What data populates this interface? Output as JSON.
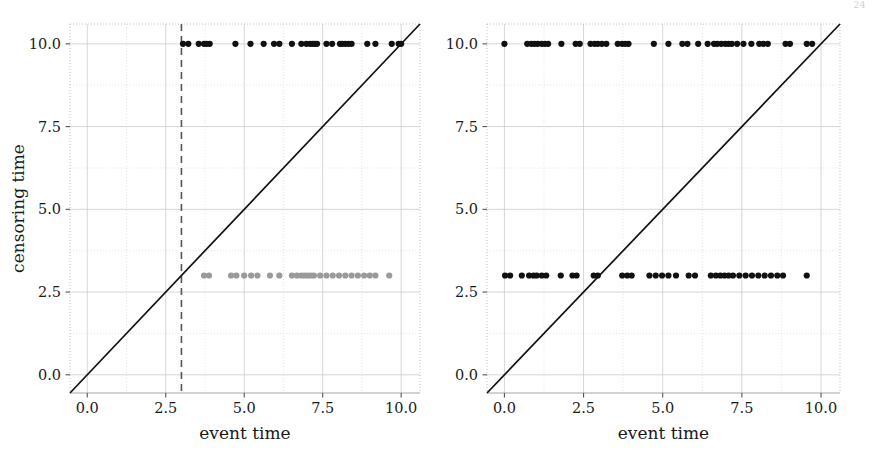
{
  "figure": {
    "corner_mark": "24",
    "background": "#ffffff"
  },
  "chart_data": [
    {
      "id": "left",
      "type": "scatter",
      "title": "",
      "xlabel": "event time",
      "ylabel": "censoring time",
      "xlim": [
        -0.55,
        10.6
      ],
      "ylim": [
        -0.55,
        10.6
      ],
      "xticks": [
        0.0,
        2.5,
        5.0,
        7.5,
        10.0
      ],
      "xticklabels": [
        "0.0",
        "2.5",
        "5.0",
        "7.5",
        "10.0"
      ],
      "yticks": [
        0.0,
        2.5,
        5.0,
        7.5,
        10.0
      ],
      "yticklabels": [
        "0.0",
        "2.5",
        "5.0",
        "7.5",
        "10.0"
      ],
      "grid": true,
      "grid_color": "#cccccc",
      "legend": null,
      "annotations": [
        {
          "kind": "vline",
          "name": "administrative-censoring-threshold",
          "x": 3.0,
          "style": "dashed",
          "color": "#555555"
        },
        {
          "kind": "line",
          "name": "identity-line",
          "points": [
            [
              -0.55,
              -0.55
            ],
            [
              10.6,
              10.6
            ]
          ],
          "style": "solid",
          "color": "#111111"
        }
      ],
      "series": [
        {
          "name": "censored-at-10",
          "marker": "o",
          "color": "#111111",
          "y_constant": 10.0,
          "x": [
            3.05,
            3.22,
            3.55,
            3.72,
            3.8,
            3.9,
            4.72,
            5.2,
            5.62,
            5.95,
            6.12,
            6.52,
            6.82,
            6.98,
            7.1,
            7.18,
            7.25,
            7.32,
            7.62,
            7.8,
            8.05,
            8.12,
            8.22,
            8.32,
            8.42,
            8.92,
            9.18,
            9.7,
            9.92,
            10.0
          ],
          "y": [
            10.0,
            10.0,
            10.0,
            10.0,
            10.0,
            10.0,
            10.0,
            10.0,
            10.0,
            10.0,
            10.0,
            10.0,
            10.0,
            10.0,
            10.0,
            10.0,
            10.0,
            10.0,
            10.0,
            10.0,
            10.0,
            10.0,
            10.0,
            10.0,
            10.0,
            10.0,
            10.0,
            10.0,
            10.0,
            10.0
          ]
        },
        {
          "name": "censored-at-3",
          "marker": "o",
          "color": "#9a9a9a",
          "y_constant": 3.0,
          "x": [
            3.72,
            3.88,
            4.58,
            4.75,
            5.0,
            5.22,
            5.42,
            5.82,
            6.12,
            6.52,
            6.68,
            6.82,
            6.92,
            7.02,
            7.12,
            7.22,
            7.42,
            7.62,
            7.82,
            8.02,
            8.22,
            8.42,
            8.62,
            8.82,
            9.0,
            9.18,
            9.62
          ],
          "y": [
            3.0,
            3.0,
            3.0,
            3.0,
            3.0,
            3.0,
            3.0,
            3.0,
            3.0,
            3.0,
            3.0,
            3.0,
            3.0,
            3.0,
            3.0,
            3.0,
            3.0,
            3.0,
            3.0,
            3.0,
            3.0,
            3.0,
            3.0,
            3.0,
            3.0,
            3.0,
            3.0
          ]
        }
      ]
    },
    {
      "id": "right",
      "type": "scatter",
      "title": "",
      "xlabel": "event time",
      "ylabel": "",
      "xlim": [
        -0.55,
        10.6
      ],
      "ylim": [
        -0.55,
        10.6
      ],
      "xticks": [
        0.0,
        2.5,
        5.0,
        7.5,
        10.0
      ],
      "xticklabels": [
        "0.0",
        "2.5",
        "5.0",
        "7.5",
        "10.0"
      ],
      "yticks": [
        0.0,
        2.5,
        5.0,
        7.5,
        10.0
      ],
      "yticklabels": [
        "0.0",
        "2.5",
        "5.0",
        "7.5",
        "10.0"
      ],
      "grid": true,
      "grid_color": "#cccccc",
      "legend": null,
      "annotations": [
        {
          "kind": "line",
          "name": "identity-line",
          "points": [
            [
              -0.55,
              -0.55
            ],
            [
              10.6,
              10.6
            ]
          ],
          "style": "solid",
          "color": "#111111"
        }
      ],
      "series": [
        {
          "name": "censored-at-10",
          "marker": "o",
          "color": "#111111",
          "y_constant": 10.0,
          "x": [
            0.0,
            0.72,
            0.85,
            0.95,
            1.05,
            1.18,
            1.28,
            1.38,
            1.8,
            2.25,
            2.38,
            2.72,
            2.85,
            2.95,
            3.08,
            3.22,
            3.58,
            3.72,
            3.82,
            3.92,
            4.72,
            5.18,
            5.62,
            5.78,
            6.12,
            6.42,
            6.62,
            6.72,
            6.85,
            6.98,
            7.08,
            7.18,
            7.35,
            7.55,
            7.8,
            8.05,
            8.18,
            8.32,
            8.88,
            9.02,
            9.55,
            9.72
          ],
          "y": [
            10.0,
            10.0,
            10.0,
            10.0,
            10.0,
            10.0,
            10.0,
            10.0,
            10.0,
            10.0,
            10.0,
            10.0,
            10.0,
            10.0,
            10.0,
            10.0,
            10.0,
            10.0,
            10.0,
            10.0,
            10.0,
            10.0,
            10.0,
            10.0,
            10.0,
            10.0,
            10.0,
            10.0,
            10.0,
            10.0,
            10.0,
            10.0,
            10.0,
            10.0,
            10.0,
            10.0,
            10.0,
            10.0,
            10.0,
            10.0,
            10.0,
            10.0
          ]
        },
        {
          "name": "censored-at-3",
          "marker": "o",
          "color": "#111111",
          "y_constant": 3.0,
          "x": [
            0.02,
            0.18,
            0.55,
            0.78,
            0.92,
            1.02,
            1.18,
            1.32,
            1.78,
            2.15,
            2.28,
            2.82,
            2.95,
            3.72,
            3.88,
            4.02,
            4.58,
            4.78,
            4.98,
            5.18,
            5.42,
            5.82,
            6.02,
            6.52,
            6.68,
            6.82,
            6.95,
            7.08,
            7.22,
            7.42,
            7.62,
            7.82,
            8.02,
            8.22,
            8.42,
            8.62,
            8.8,
            9.55
          ],
          "y": [
            3.0,
            3.0,
            3.0,
            3.0,
            3.0,
            3.0,
            3.0,
            3.0,
            3.0,
            3.0,
            3.0,
            3.0,
            3.0,
            3.0,
            3.0,
            3.0,
            3.0,
            3.0,
            3.0,
            3.0,
            3.0,
            3.0,
            3.0,
            3.0,
            3.0,
            3.0,
            3.0,
            3.0,
            3.0,
            3.0,
            3.0,
            3.0,
            3.0,
            3.0,
            3.0,
            3.0,
            3.0,
            3.0
          ]
        }
      ]
    }
  ]
}
